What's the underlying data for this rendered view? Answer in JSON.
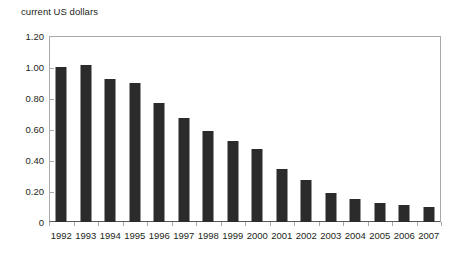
{
  "chart_data": {
    "type": "bar",
    "title": "current US dollars",
    "xlabel": "",
    "ylabel": "current US dollars",
    "categories": [
      "1992",
      "1993",
      "1994",
      "1995",
      "1996",
      "1997",
      "1998",
      "1999",
      "2000",
      "2001",
      "2002",
      "2003",
      "2004",
      "2005",
      "2006",
      "2007"
    ],
    "values": [
      1.0,
      1.01,
      0.92,
      0.9,
      0.77,
      0.67,
      0.59,
      0.52,
      0.47,
      0.34,
      0.27,
      0.19,
      0.15,
      0.12,
      0.11,
      0.1
    ],
    "series": [
      {
        "name": "current US dollars",
        "values": [
          1.0,
          1.01,
          0.92,
          0.9,
          0.77,
          0.67,
          0.59,
          0.52,
          0.47,
          0.34,
          0.27,
          0.19,
          0.15,
          0.12,
          0.11,
          0.1
        ]
      }
    ],
    "ylim": [
      0,
      1.2
    ],
    "ytick_labels": [
      "0",
      "0.20",
      "0.40",
      "0.60",
      "0.80",
      "1.00",
      "1.20"
    ],
    "ytick_values": [
      0,
      0.2,
      0.4,
      0.6,
      0.8,
      1.0,
      1.2
    ],
    "grid": false,
    "legend": null,
    "legend_position": "none",
    "bar_color": "#2b2b2b",
    "axis_color": "#a7a9ac",
    "baseline_color": "#58595b",
    "text_color": "#231f20",
    "background": "#ffffff",
    "annotations": []
  }
}
